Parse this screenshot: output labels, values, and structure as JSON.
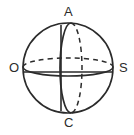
{
  "figure": {
    "name": "sphere-diagram",
    "background_color": "#ffffff",
    "stroke_color": "#2b2b2b",
    "geometry": {
      "center_x": 68,
      "center_y": 68,
      "radius": 45,
      "equator_ellipse": {
        "rx": 45,
        "ry": 9,
        "cx": 68,
        "cy": 67
      },
      "meridian_ellipse": {
        "rx": 11,
        "ry": 45,
        "cx": 71,
        "cy": 68
      },
      "equator_chord_y": 72,
      "axis_line_x": 61
    },
    "labels": [
      {
        "id": "A",
        "text": "A",
        "position": "top",
        "role": "north-pole"
      },
      {
        "id": "C",
        "text": "C",
        "position": "bottom",
        "role": "south-pole"
      },
      {
        "id": "O",
        "text": "O",
        "position": "left",
        "role": "left-point"
      },
      {
        "id": "S",
        "text": "S",
        "position": "right",
        "role": "right-point"
      }
    ],
    "line_styles": {
      "outline": "solid",
      "equator_back": "dashed",
      "equator_front": "solid",
      "meridian_front": "solid",
      "meridian_back": "dashed"
    }
  }
}
